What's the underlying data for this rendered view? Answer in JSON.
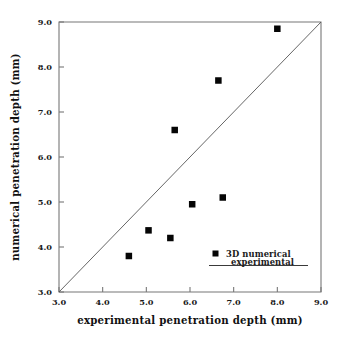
{
  "chart_data": {
    "type": "scatter",
    "title": "",
    "subtitle": "",
    "xlabel": "experimental penetration depth (mm)",
    "ylabel": "numerical penetration depth (mm)",
    "xlim": [
      3.0,
      9.0
    ],
    "ylim": [
      3.0,
      9.0
    ],
    "grid": false,
    "legend_position": "lower-right-inside",
    "x_ticks": [
      "3.0",
      "4.0",
      "5.0",
      "6.0",
      "7.0",
      "8.0",
      "9.0"
    ],
    "y_ticks": [
      "3.0",
      "4.0",
      "5.0",
      "6.0",
      "7.0",
      "8.0",
      "9.0"
    ],
    "x_tick_values": [
      3.0,
      4.0,
      5.0,
      6.0,
      7.0,
      8.0,
      9.0
    ],
    "y_tick_values": [
      3.0,
      4.0,
      5.0,
      6.0,
      7.0,
      8.0,
      9.0
    ],
    "series": [
      {
        "name": "3D numerical",
        "type": "scatter",
        "marker": "filled-square",
        "color": "#050505",
        "points": [
          {
            "x": 4.6,
            "y": 3.8
          },
          {
            "x": 5.05,
            "y": 4.37
          },
          {
            "x": 5.55,
            "y": 4.2
          },
          {
            "x": 5.65,
            "y": 6.6
          },
          {
            "x": 6.05,
            "y": 4.95
          },
          {
            "x": 6.65,
            "y": 7.7
          },
          {
            "x": 6.75,
            "y": 5.1
          },
          {
            "x": 8.0,
            "y": 8.85
          }
        ]
      },
      {
        "name": "experimental",
        "type": "line",
        "marker": "none",
        "color": "#555555",
        "description": "y = x parity line",
        "points": [
          {
            "x": 3.0,
            "y": 3.0
          },
          {
            "x": 9.0,
            "y": 9.0
          }
        ]
      }
    ],
    "legend_entries": [
      {
        "label": "3D numerical",
        "symbol": "filled-square"
      },
      {
        "label": "experimental",
        "symbol": "line"
      }
    ]
  },
  "axes": {
    "x_title": "experimental penetration depth (mm)",
    "y_title": "numerical penetration depth (mm)"
  },
  "legend": {
    "numerical_label": "3D numerical",
    "experimental_label": "experimental"
  },
  "ticks": {
    "x": [
      "3.0",
      "4.0",
      "5.0",
      "6.0",
      "7.0",
      "8.0",
      "9.0"
    ],
    "y": [
      "3.0",
      "4.0",
      "5.0",
      "6.0",
      "7.0",
      "8.0",
      "9.0"
    ]
  },
  "colors": {
    "marker": "#050505",
    "parity_line": "#555555",
    "frame": "#777777",
    "background": "#ffffff",
    "text": "#111111"
  }
}
